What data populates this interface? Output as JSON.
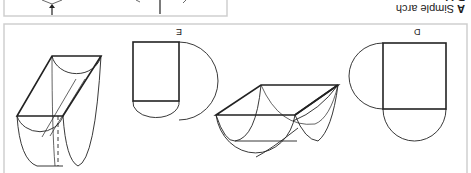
{
  "figure": {
    "captions": [
      {
        "key": "A",
        "text": "Simple arch"
      },
      {
        "key": "B",
        "text": "M..."
      }
    ],
    "panel_labels": {
      "d": "D",
      "e": "E"
    },
    "orientation": "rotated 180 degrees",
    "colors": {
      "line": "#222222",
      "border": "#cccccc",
      "background": "#ffffff"
    }
  }
}
